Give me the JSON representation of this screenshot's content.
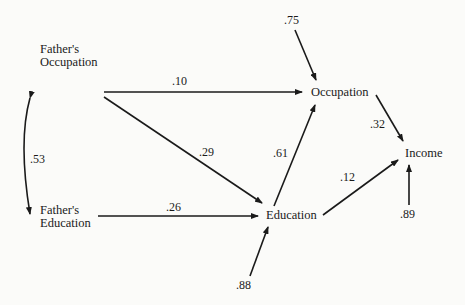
{
  "nodes": {
    "fathers_occupation": {
      "line1": "Father's",
      "line2": "Occupation"
    },
    "fathers_education": {
      "line1": "Father's",
      "line2": "Education"
    },
    "occupation": {
      "label": "Occupation"
    },
    "education": {
      "label": "Education"
    },
    "income": {
      "label": "Income"
    }
  },
  "paths": {
    "correlation_fo_fe": ".53",
    "fo_to_occupation": ".10",
    "fo_to_education": ".29",
    "fe_to_education": ".26",
    "education_to_occupation": ".61",
    "occupation_to_income": ".32",
    "education_to_income": ".12",
    "residual_occupation": ".75",
    "residual_education": ".88",
    "residual_income": ".89"
  }
}
